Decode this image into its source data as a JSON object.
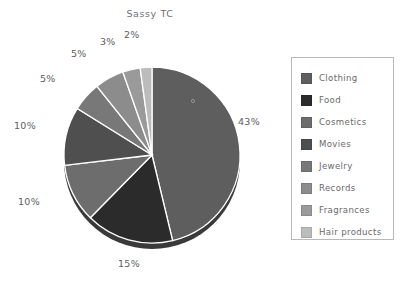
{
  "chart_data": {
    "type": "pie",
    "title": "Sassy TC",
    "xlabel": "",
    "ylabel": "",
    "legend_position": "right",
    "grid": false,
    "categories": [
      "Clothing",
      "Food",
      "Cosmetics",
      "Movies",
      "Jewelry",
      "Records",
      "Fragrances",
      "Hair products"
    ],
    "values": [
      43,
      15,
      10,
      10,
      5,
      5,
      3,
      2
    ],
    "value_labels": [
      "43%",
      "15%",
      "10%",
      "10%",
      "5%",
      "5%",
      "3%",
      "2%"
    ],
    "colors": [
      "#5e5e5e",
      "#2b2b2b",
      "#6d6d6d",
      "#4f4f4f",
      "#787878",
      "#8c8c8c",
      "#9a9a9a",
      "#bcbcbc"
    ],
    "shadow_color": "#3a3a3a",
    "separator_color": "#ffffff",
    "start_angle_deg": 0,
    "direction": "clockwise"
  },
  "chart": {
    "title": "Sassy TC"
  },
  "legend": {
    "border_color": "#b9b9b9",
    "items": [
      {
        "label": "Clothing",
        "color": "#5e5e5e",
        "value_label": "43%"
      },
      {
        "label": "Food",
        "color": "#2b2b2b",
        "value_label": "15%"
      },
      {
        "label": "Cosmetics",
        "color": "#6d6d6d",
        "value_label": "10%"
      },
      {
        "label": "Movies",
        "color": "#4f4f4f",
        "value_label": "10%"
      },
      {
        "label": "Jewelry",
        "color": "#787878",
        "value_label": "5%"
      },
      {
        "label": "Records",
        "color": "#8c8c8c",
        "value_label": "5%"
      },
      {
        "label": "Fragrances",
        "color": "#9a9a9a",
        "value_label": "3%"
      },
      {
        "label": "Hair products",
        "color": "#bcbcbc",
        "value_label": "2%"
      }
    ]
  },
  "pie_labels": [
    {
      "text": "43%",
      "x": 238,
      "y": 116
    },
    {
      "text": "15%",
      "x": 118,
      "y": 258
    },
    {
      "text": "10%",
      "x": 18,
      "y": 196
    },
    {
      "text": "10%",
      "x": 14,
      "y": 120
    },
    {
      "text": "5%",
      "x": 40,
      "y": 73
    },
    {
      "text": "5%",
      "x": 71,
      "y": 48
    },
    {
      "text": "3%",
      "x": 100,
      "y": 36
    },
    {
      "text": "2%",
      "x": 124,
      "y": 29
    }
  ]
}
